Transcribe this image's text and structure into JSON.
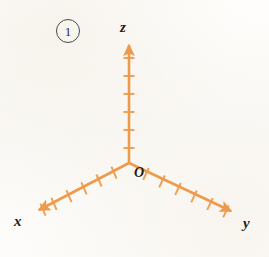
{
  "figure": {
    "badge_number": "1",
    "background_color": "#fdfcfa",
    "axis_color": "#ee9a4d",
    "label_color": "#1b1b1b",
    "origin_label": "O",
    "axes": [
      {
        "name": "x",
        "label": "x",
        "direction": "down-left",
        "tick_count": 6,
        "arrowhead": true,
        "origin": {
          "x": 129,
          "y": 163
        },
        "tip": {
          "x": 33,
          "y": 213
        }
      },
      {
        "name": "y",
        "label": "y",
        "direction": "down-right",
        "tick_count": 6,
        "arrowhead": true,
        "origin": {
          "x": 129,
          "y": 163
        },
        "tip": {
          "x": 237,
          "y": 214
        }
      },
      {
        "name": "z",
        "label": "z",
        "direction": "up",
        "tick_count": 6,
        "arrowhead": true,
        "origin": {
          "x": 129,
          "y": 163
        },
        "tip": {
          "x": 129,
          "y": 40
        }
      }
    ]
  }
}
